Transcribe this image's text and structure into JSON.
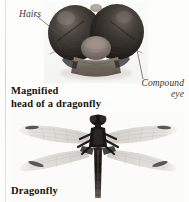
{
  "figure": {
    "background_color": "#fdfdfb",
    "rule_color": "#dcdcd8"
  },
  "panels": [
    {
      "name": "magnified-head",
      "caption": "Magnified\nhead of a dragonfly",
      "subject": "dragonfly head, frontal view",
      "callouts": [
        {
          "name": "hairs",
          "label": "Hairs"
        },
        {
          "name": "compound-eye",
          "label": "Compound\neye"
        }
      ]
    },
    {
      "name": "whole-dragonfly",
      "caption": "Dragonfly",
      "subject": "dragonfly, dorsal view with four wings spread"
    }
  ],
  "labels": {
    "hairs": "Hairs",
    "compound_eye": "Compound\neye",
    "caption_head": "Magnified\nhead of a dragonfly",
    "caption_dragonfly": "Dragonfly"
  },
  "colors": {
    "eye_dark": "#2e2a27",
    "eye_highlight": "#6d6560",
    "face_pale": "#8d837a",
    "body_dark": "#1d1a17",
    "wing_translucent": "#dedbd6",
    "text_caption": "#17140f",
    "text_callout": "#3c3a38"
  }
}
